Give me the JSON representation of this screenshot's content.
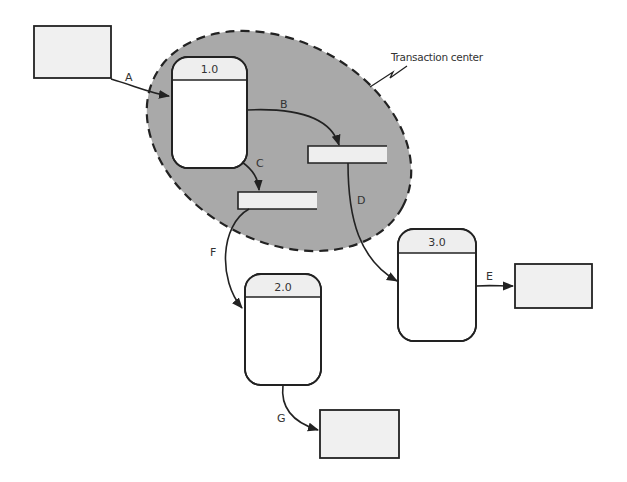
{
  "diagram": {
    "type": "data-flow-diagram",
    "annotation": "Transaction center",
    "colors": {
      "background": "#ffffff",
      "region_fill": "#a9a9a9",
      "stroke": "#222222",
      "entity_fill": "#f0f0f0",
      "store_fill": "#eeeeee",
      "process_header_fill": "#eeeeee",
      "process_body_fill": "#ffffff"
    },
    "processes": [
      {
        "id": "1.0",
        "label": "1.0"
      },
      {
        "id": "2.0",
        "label": "2.0"
      },
      {
        "id": "3.0",
        "label": "3.0"
      }
    ],
    "external_entities": [
      {
        "id": "source",
        "label": ""
      },
      {
        "id": "sink-e",
        "label": ""
      },
      {
        "id": "sink-g",
        "label": ""
      }
    ],
    "data_stores": [
      {
        "id": "store-b",
        "label": ""
      },
      {
        "id": "store-c",
        "label": ""
      }
    ],
    "flows": [
      {
        "label": "A",
        "from": "source",
        "to": "1.0"
      },
      {
        "label": "B",
        "from": "1.0",
        "to": "store-b"
      },
      {
        "label": "C",
        "from": "1.0",
        "to": "store-c"
      },
      {
        "label": "D",
        "from": "store-b",
        "to": "3.0"
      },
      {
        "label": "E",
        "from": "3.0",
        "to": "sink-e"
      },
      {
        "label": "F",
        "from": "store-c",
        "to": "2.0"
      },
      {
        "label": "G",
        "from": "2.0",
        "to": "sink-g"
      }
    ]
  }
}
